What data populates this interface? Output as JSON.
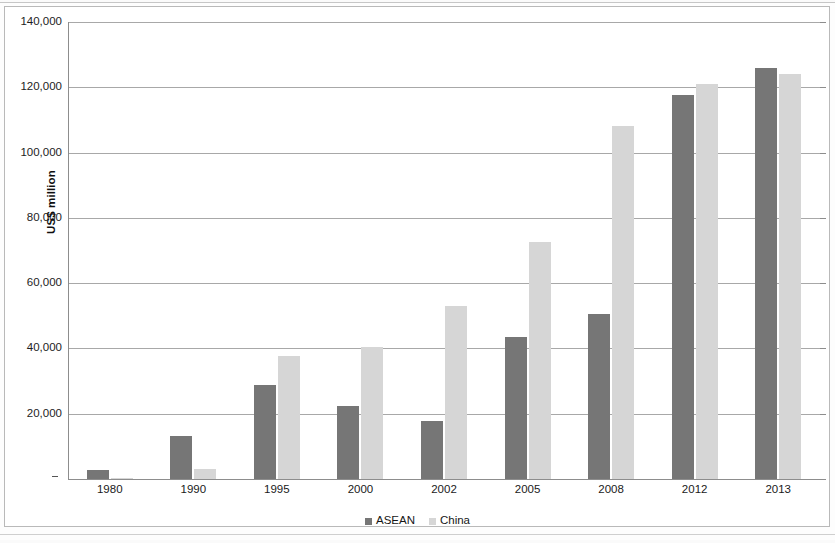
{
  "chart_data": {
    "type": "bar",
    "title": "",
    "subtitle": "",
    "xlabel": "",
    "ylabel": "US$ million",
    "ylim": [
      0,
      140000
    ],
    "ytick_step": 20000,
    "grid": true,
    "legend_position": "bottom",
    "zero_tick_label": "-",
    "categories": [
      "1980",
      "1990",
      "1995",
      "2000",
      "2002",
      "2005",
      "2008",
      "2012",
      "2013"
    ],
    "ytick_labels": [
      "140,000",
      "120,000",
      "100,000",
      "80,000",
      "60,000",
      "40,000",
      "20,000",
      "-"
    ],
    "ytick_values": [
      140000,
      120000,
      100000,
      80000,
      60000,
      40000,
      20000,
      0
    ],
    "series": [
      {
        "name": "ASEAN",
        "color": "#767676",
        "values": [
          2800,
          13300,
          28800,
          22500,
          17700,
          43500,
          50500,
          117500,
          126000
        ]
      },
      {
        "name": "China",
        "color": "#d6d6d6",
        "values": [
          300,
          3000,
          37800,
          40300,
          53000,
          72500,
          108000,
          121000,
          124000
        ]
      }
    ]
  },
  "legend": {
    "entries": [
      {
        "label": "ASEAN",
        "marker": "square-dark"
      },
      {
        "label": "China",
        "marker": "square-light"
      }
    ]
  },
  "axis": {
    "y_title": "US$ million"
  }
}
